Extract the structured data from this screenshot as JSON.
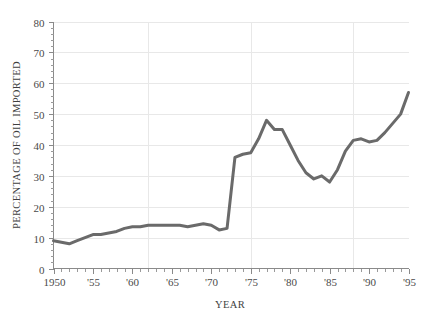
{
  "chart_data": {
    "type": "line",
    "title": "",
    "subtitle": "",
    "xlabel": "YEAR",
    "ylabel": "PERCENTAGE OF OIL IMPORTED",
    "xlim": [
      1950,
      1995
    ],
    "ylim": [
      0,
      80
    ],
    "grid": true,
    "legend": null,
    "legend_position": "none",
    "line_color": "#6a6a6a",
    "grid_color": "#e8e8e8",
    "axis_color": "#8a8a8a",
    "text_color": "#3f3f3f",
    "y_ticks": [
      0,
      10,
      20,
      30,
      40,
      50,
      60,
      70,
      80
    ],
    "y_tick_labels": [
      "0",
      "10",
      "20",
      "30",
      "40",
      "50",
      "60",
      "70",
      "80"
    ],
    "y_minor_tick_step": 2,
    "x_ticks": [
      1950,
      1955,
      1960,
      1965,
      1970,
      1975,
      1980,
      1985,
      1990,
      1995
    ],
    "x_tick_labels": [
      "1950",
      "'55",
      "'60",
      "'65",
      "'70",
      "'75",
      "'80",
      "'85",
      "'90",
      "'95"
    ],
    "x_minor_tick_step": 1,
    "x_gridlines": [
      1962,
      1975,
      1988
    ],
    "series": [
      {
        "name": "Percentage of oil imported",
        "color": "#6a6a6a",
        "x": [
          1950,
          1951,
          1952,
          1953,
          1954,
          1955,
          1956,
          1957,
          1958,
          1959,
          1960,
          1961,
          1962,
          1963,
          1964,
          1965,
          1966,
          1967,
          1968,
          1969,
          1970,
          1971,
          1972,
          1973,
          1974,
          1975,
          1976,
          1977,
          1978,
          1979,
          1980,
          1981,
          1982,
          1983,
          1984,
          1985,
          1986,
          1987,
          1988,
          1989,
          1990,
          1991,
          1992,
          1993,
          1994,
          1995
        ],
        "values": [
          9,
          8.5,
          8,
          9,
          10,
          11,
          11,
          11.5,
          12,
          13,
          13.5,
          13.5,
          14,
          14,
          14,
          14,
          14,
          13.5,
          14,
          14.5,
          14,
          12.5,
          13,
          36,
          37,
          37.5,
          42,
          48,
          45,
          45,
          40,
          35,
          31,
          29,
          30,
          28,
          32,
          38,
          41.5,
          42,
          41,
          41.5,
          44,
          47,
          50,
          57
        ]
      }
    ]
  }
}
